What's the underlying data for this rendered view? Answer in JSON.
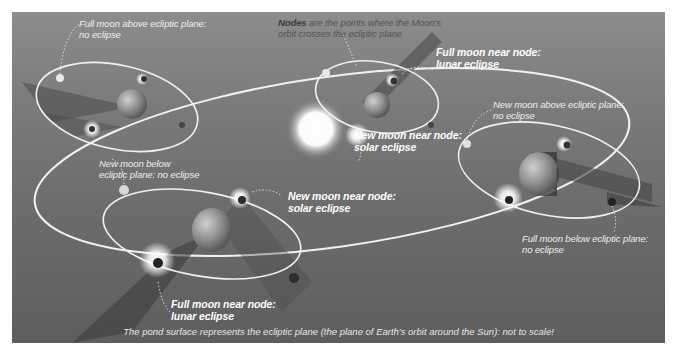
{
  "figure": {
    "caption": "The pond surface represents the ecliptic plane (the plane of Earth's orbit around the Sun): not to scale!",
    "sun": {
      "label": ""
    },
    "colors": {
      "background_top": "#8c8c8c",
      "background_bottom": "#5e5e5e",
      "orbit_line": "#f2f2f2",
      "label_text": "#ffffff",
      "nodes_text": "#555555"
    }
  },
  "labels": {
    "nodes_note": {
      "bold": "Nodes",
      "rest_line1": " are the points where the Moon's",
      "line2": "orbit crosses the ecliptic plane"
    },
    "full_above": {
      "line1": "Full moon above ecliptic plane:",
      "line2": "no eclipse"
    },
    "full_node_top": {
      "line1": "Full moon near node:",
      "line2": "lunar eclipse"
    },
    "new_node_center": {
      "line1": "New moon near node:",
      "line2": "solar eclipse"
    },
    "new_above_right": {
      "line1": "New moon above ecliptic plane:",
      "line2": "no eclipse"
    },
    "new_below_left": {
      "line1": "New moon below",
      "line2": "ecliptic plane: no eclipse"
    },
    "new_node_bottom": {
      "line1": "New moon near node:",
      "line2": "solar eclipse"
    },
    "full_below_right": {
      "line1": "Full moon below ecliptic plane:",
      "line2": "no eclipse"
    },
    "full_node_bottom": {
      "line1": "Full moon near node:",
      "line2": "lunar eclipse"
    }
  }
}
